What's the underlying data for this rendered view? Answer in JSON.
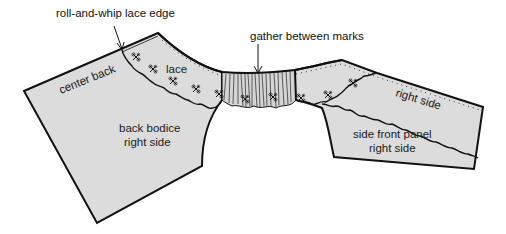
{
  "diagram": {
    "type": "sewing-pattern-illustration",
    "colors": {
      "fabric_fill": "#dcdcdc",
      "outline": "#111111",
      "background": "#ffffff"
    },
    "callouts": {
      "lace_edge": "roll-and-whip lace edge",
      "gather": "gather between marks"
    },
    "pieces": {
      "back_bodice": {
        "edge_label": "center back",
        "lace_label": "lace",
        "name_line1": "back bodice",
        "name_line2": "right side"
      },
      "side_front_panel": {
        "edge_label": "right side",
        "name_line1": "side front panel",
        "name_line2": "right side"
      }
    }
  }
}
